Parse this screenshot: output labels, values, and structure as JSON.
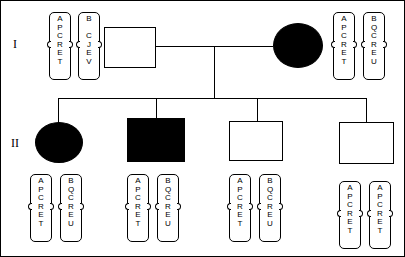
{
  "figure": {
    "type": "pedigree-chart",
    "width": 405,
    "height": 257,
    "background_color": "#ffffff",
    "line_color": "#000000",
    "affected_fill_color": "#000000",
    "unaffected_fill_color": "#ffffff"
  },
  "generations": [
    {
      "id": "gen-1",
      "label": "I"
    },
    {
      "id": "gen-2",
      "label": "II"
    }
  ],
  "individuals": [
    {
      "id": "I-1",
      "sex": "male",
      "shape": "square",
      "affected": false,
      "generation": "I"
    },
    {
      "id": "I-2",
      "sex": "female",
      "shape": "circle",
      "affected": true,
      "generation": "I"
    },
    {
      "id": "II-1",
      "sex": "female",
      "shape": "circle",
      "affected": true,
      "generation": "II"
    },
    {
      "id": "II-2",
      "sex": "male",
      "shape": "square",
      "affected": true,
      "generation": "II"
    },
    {
      "id": "II-3",
      "sex": "male",
      "shape": "square",
      "affected": false,
      "generation": "II"
    },
    {
      "id": "II-4",
      "sex": "male",
      "shape": "square",
      "affected": false,
      "generation": "II"
    }
  ],
  "haplotypes": [
    {
      "individual": "I-1",
      "position": "left-of-symbol",
      "bars": [
        {
          "id": "I-1-a",
          "alleles": [
            "A",
            "P",
            "C",
            "R",
            "E",
            "T"
          ]
        },
        {
          "id": "I-1-b",
          "alleles": [
            "B",
            "",
            "C",
            "J",
            "E",
            "V"
          ]
        }
      ]
    },
    {
      "individual": "I-2",
      "position": "right-of-symbol",
      "bars": [
        {
          "id": "I-2-a",
          "alleles": [
            "A",
            "P",
            "C",
            "R",
            "E",
            "T"
          ]
        },
        {
          "id": "I-2-b",
          "alleles": [
            "B",
            "Q",
            "C",
            "R",
            "E",
            "U"
          ]
        }
      ]
    },
    {
      "individual": "II-1",
      "position": "below-symbol",
      "bars": [
        {
          "id": "II-1-a",
          "alleles": [
            "A",
            "P",
            "C",
            "R",
            "E",
            "T"
          ]
        },
        {
          "id": "II-1-b",
          "alleles": [
            "B",
            "Q",
            "C",
            "R",
            "E",
            "U"
          ]
        }
      ]
    },
    {
      "individual": "II-2",
      "position": "below-symbol",
      "bars": [
        {
          "id": "II-2-a",
          "alleles": [
            "A",
            "P",
            "C",
            "R",
            "E",
            "T"
          ]
        },
        {
          "id": "II-2-b",
          "alleles": [
            "B",
            "Q",
            "C",
            "R",
            "E",
            "U"
          ]
        }
      ]
    },
    {
      "individual": "II-3",
      "position": "below-symbol",
      "bars": [
        {
          "id": "II-3-a",
          "alleles": [
            "A",
            "P",
            "C",
            "R",
            "E",
            "T"
          ]
        },
        {
          "id": "II-3-b",
          "alleles": [
            "B",
            "Q",
            "C",
            "R",
            "E",
            "U"
          ]
        }
      ]
    },
    {
      "individual": "II-4",
      "position": "below-symbol",
      "bars": [
        {
          "id": "II-4-a",
          "alleles": [
            "A",
            "P",
            "C",
            "R",
            "E",
            "T"
          ]
        },
        {
          "id": "II-4-b",
          "alleles": [
            "A",
            "P",
            "C",
            "R",
            "E",
            "T"
          ]
        }
      ]
    }
  ]
}
